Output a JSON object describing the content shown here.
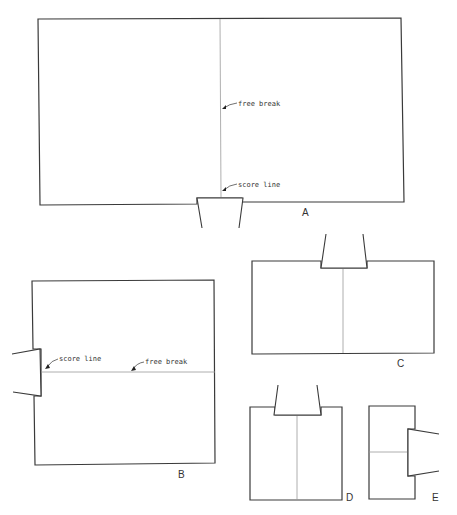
{
  "figures": {
    "A": {
      "label": "A",
      "annotations": {
        "free_break": "free break",
        "score_line": "score line"
      }
    },
    "B": {
      "label": "B",
      "annotations": {
        "score_line": "score line",
        "free_break": "free break"
      }
    },
    "C": {
      "label": "C"
    },
    "D": {
      "label": "D"
    },
    "E": {
      "label": "E"
    }
  },
  "colors": {
    "outline": "#3a3a3a",
    "break_line": "#9a9a9a",
    "background": "#ffffff"
  }
}
